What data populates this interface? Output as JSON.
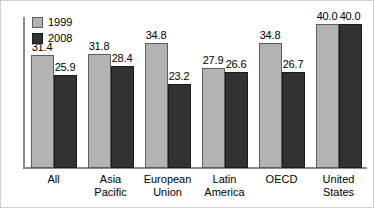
{
  "chart_data": {
    "type": "bar",
    "title": "",
    "subtitle": "",
    "xlabel": "",
    "ylabel": "",
    "ylim": [
      0,
      40
    ],
    "grid": false,
    "legend_position": "top-left",
    "categories": [
      "All",
      "Asia\nPacific",
      "European\nUnion",
      "Latin\nAmerica",
      "OECD",
      "United\nStates"
    ],
    "series": [
      {
        "name": "1999",
        "color": "#b3b3b3",
        "values": [
          31.4,
          31.8,
          34.8,
          27.9,
          34.8,
          40.0
        ],
        "labels": [
          "31.4",
          "31.8",
          "34.8",
          "27.9",
          "34.8",
          "40.0"
        ]
      },
      {
        "name": "2008",
        "color": "#323232",
        "values": [
          25.9,
          28.4,
          23.2,
          26.6,
          26.7,
          40.0
        ],
        "labels": [
          "25.9",
          "28.4",
          "23.2",
          "26.6",
          "26.7",
          "40.0"
        ]
      }
    ]
  },
  "legend": {
    "items": [
      {
        "label": "1999",
        "swatch": "legend-swatch-1999"
      },
      {
        "label": "2008",
        "swatch": "legend-swatch-2008"
      }
    ]
  },
  "axis": {
    "baseline_color": "#8a8a8a",
    "spine_color": "#8a8a8a"
  }
}
